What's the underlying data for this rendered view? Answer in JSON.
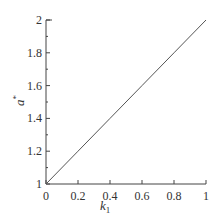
{
  "chart_data": {
    "type": "line",
    "title": "",
    "xlabel": "k1",
    "ylabel": "a*",
    "xlim": [
      0,
      1
    ],
    "ylim": [
      1,
      2
    ],
    "x_ticks": [
      "0",
      "0.2",
      "0.4",
      "0.6",
      "0.8",
      "1"
    ],
    "y_ticks": [
      "1",
      "1.2",
      "1.4",
      "1.6",
      "1.8",
      "2"
    ],
    "grid": false,
    "legend": null,
    "series": [
      {
        "name": "a*",
        "x": [
          0,
          0.2,
          0.4,
          0.6,
          0.8,
          1.0
        ],
        "y": [
          1.0,
          1.2,
          1.4,
          1.6,
          1.8,
          2.0
        ]
      }
    ]
  },
  "labels": {
    "x_main": "k",
    "x_sub": "1",
    "y_main": "a",
    "y_sup": "*"
  }
}
